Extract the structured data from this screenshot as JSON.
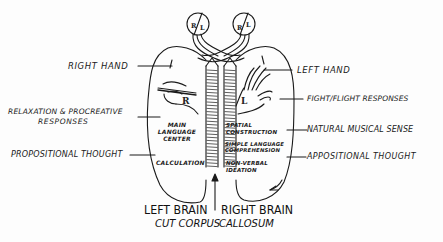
{
  "diagram": {
    "eyes": {
      "left_eye": {
        "left_field": "R",
        "right_field": "L"
      },
      "right_eye": {
        "left_field": "R",
        "right_field": "L"
      }
    },
    "hands": {
      "left_hemisphere_hand_label": "R",
      "right_hemisphere_hand_label": "L"
    },
    "left_side_labels": {
      "right_hand": "RIGHT HAND",
      "relaxation_line1": "RELAXATION & PROCREATIVE",
      "relaxation_line2": "RESPONSES",
      "propositional": "PROPOSITIONAL THOUGHT"
    },
    "right_side_labels": {
      "left_hand": "LEFT HAND",
      "fight_flight": "FIGHT/FLIGHT RESPONSES",
      "musical": "NATURAL MUSICAL SENSE",
      "appositional": "APPOSITIONAL THOUGHT"
    },
    "left_hemisphere_functions": {
      "main_language_1": "MAIN",
      "main_language_2": "LANGUAGE",
      "main_language_3": "CENTER",
      "calculation": "CALCULATION"
    },
    "right_hemisphere_functions": {
      "spatial_1": "SPATIAL",
      "spatial_2": "CONSTRUCTION",
      "simple_lang_1": "SIMPLE LANGUAGE",
      "simple_lang_2": "COMPREHENSION",
      "nonverbal_1": "NON-VERBAL",
      "nonverbal_2": "IDEATION"
    },
    "bottom_labels": {
      "left_brain": "LEFT BRAIN",
      "right_brain": "RIGHT BRAIN",
      "cut_corpus": "CUT CORPUS",
      "callosum": "CALLOSUM"
    },
    "colors": {
      "ink": "#1a1a1a",
      "paper": "#fdfdfd"
    }
  }
}
